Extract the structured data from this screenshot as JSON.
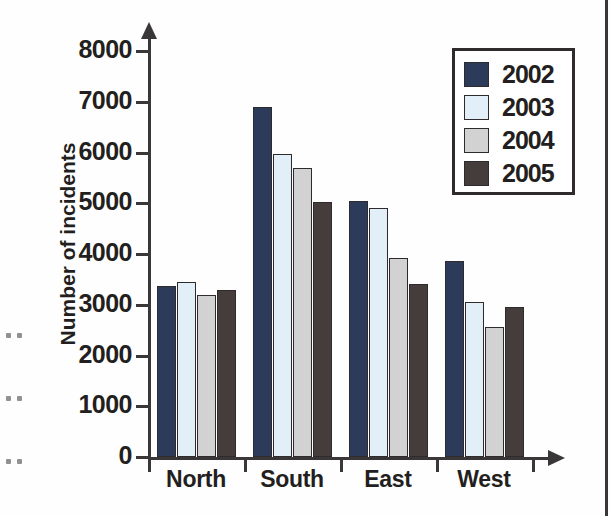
{
  "chart_data": {
    "type": "bar",
    "title": "",
    "subtitle": "",
    "xlabel": "",
    "ylabel": "Number of incidents",
    "categories": [
      "North",
      "South",
      "East",
      "West"
    ],
    "ylim": [
      0,
      8000
    ],
    "yticks": [
      "0",
      "1000",
      "2000",
      "3000",
      "4000",
      "5000",
      "6000",
      "7000",
      "8000"
    ],
    "grid": false,
    "legend_position": "top-right",
    "series": [
      {
        "name": "2002",
        "color": "#2c3b5a",
        "values": [
          3370,
          6900,
          5050,
          3860
        ]
      },
      {
        "name": "2003",
        "color": "#e2eff8",
        "values": [
          3450,
          5970,
          4910,
          3050
        ]
      },
      {
        "name": "2004",
        "color": "#d2d2d2",
        "values": [
          3190,
          5700,
          3920,
          2560
        ]
      },
      {
        "name": "2005",
        "color": "#453d3c",
        "values": [
          3290,
          5030,
          3410,
          2960
        ]
      }
    ],
    "axis_color": "#3a3738",
    "label_color": "#231f20"
  }
}
